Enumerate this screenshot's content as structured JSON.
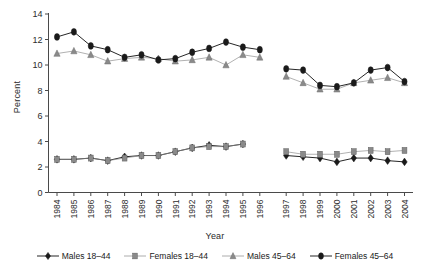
{
  "chart_data": {
    "type": "line",
    "title": "",
    "xlabel": "Year",
    "ylabel": "Percent",
    "ylim": [
      0,
      14
    ],
    "ytick_step": 2,
    "yticks": [
      0,
      2,
      4,
      6,
      8,
      10,
      12,
      14
    ],
    "grid": false,
    "legend_position": "bottom",
    "x_break": true,
    "x_break_note": "Gap between 1996 and 1997 (series discontinued and restarted)",
    "categories": [
      1984,
      1985,
      1986,
      1987,
      1988,
      1989,
      1990,
      1991,
      1992,
      1993,
      1994,
      1995,
      1996,
      1997,
      1998,
      1999,
      2000,
      2001,
      2002,
      2003,
      2004
    ],
    "xticklabels": [
      "1984",
      "1985",
      "1986",
      "1987",
      "1988",
      "1989",
      "1990",
      "1991",
      "1992",
      "1993",
      "1994",
      "1995",
      "1996",
      "1997",
      "1998",
      "1999",
      "2000",
      "2001",
      "2002",
      "2003",
      "2004"
    ],
    "series": [
      {
        "name": "Males 18-44",
        "legend_label": "Males 18–44",
        "marker": "diamond",
        "color": "#1a1a1a",
        "values": [
          2.6,
          2.6,
          2.7,
          2.5,
          2.8,
          2.9,
          2.9,
          3.2,
          3.5,
          3.7,
          3.6,
          3.8,
          null,
          2.9,
          2.8,
          2.7,
          2.4,
          2.7,
          2.7,
          2.5,
          2.4
        ]
      },
      {
        "name": "Females 18-44",
        "legend_label": "Females 18–44",
        "marker": "square",
        "color": "#8a8a8a",
        "values": [
          2.6,
          2.6,
          2.7,
          2.5,
          2.7,
          2.9,
          2.9,
          3.2,
          3.5,
          3.6,
          3.6,
          3.8,
          null,
          3.2,
          3.0,
          3.0,
          3.0,
          3.2,
          3.3,
          3.2,
          3.3
        ]
      },
      {
        "name": "Males 45-64",
        "legend_label": "Males 45–64",
        "marker": "triangle",
        "color": "#8a8a8a",
        "values": [
          10.9,
          11.1,
          10.8,
          10.3,
          10.5,
          10.6,
          10.5,
          10.3,
          10.4,
          10.6,
          10.0,
          10.8,
          10.6,
          9.1,
          8.6,
          8.1,
          8.1,
          8.6,
          8.8,
          9.0,
          8.6
        ]
      },
      {
        "name": "Females 45-64",
        "legend_label": "Females 45–64",
        "marker": "circle",
        "color": "#1a1a1a",
        "values": [
          12.2,
          12.6,
          11.5,
          11.2,
          10.6,
          10.8,
          10.4,
          10.5,
          11.0,
          11.3,
          11.8,
          11.4,
          11.2,
          9.7,
          9.6,
          8.4,
          8.3,
          8.6,
          9.6,
          9.8,
          8.7
        ]
      }
    ]
  },
  "axes": {
    "ylabel": "Percent",
    "xlabel": "Year"
  },
  "colors": {
    "dark": "#1a1a1a",
    "gray": "#8a8a8a",
    "axis": "#4a4a4a",
    "background": "#ffffff"
  }
}
